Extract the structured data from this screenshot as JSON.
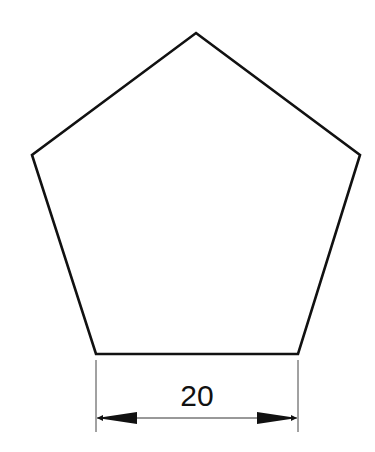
{
  "diagram": {
    "shape": "regular-pentagon",
    "vertices": [
      [
        196,
        33
      ],
      [
        360,
        155
      ],
      [
        298,
        354
      ],
      [
        96,
        354
      ],
      [
        32,
        155
      ]
    ],
    "stroke_color": "#111111",
    "dimension": {
      "label": "20",
      "from": [
        96,
        354
      ],
      "to": [
        298,
        354
      ],
      "line_y": 418,
      "extension_bottom": 432
    }
  }
}
